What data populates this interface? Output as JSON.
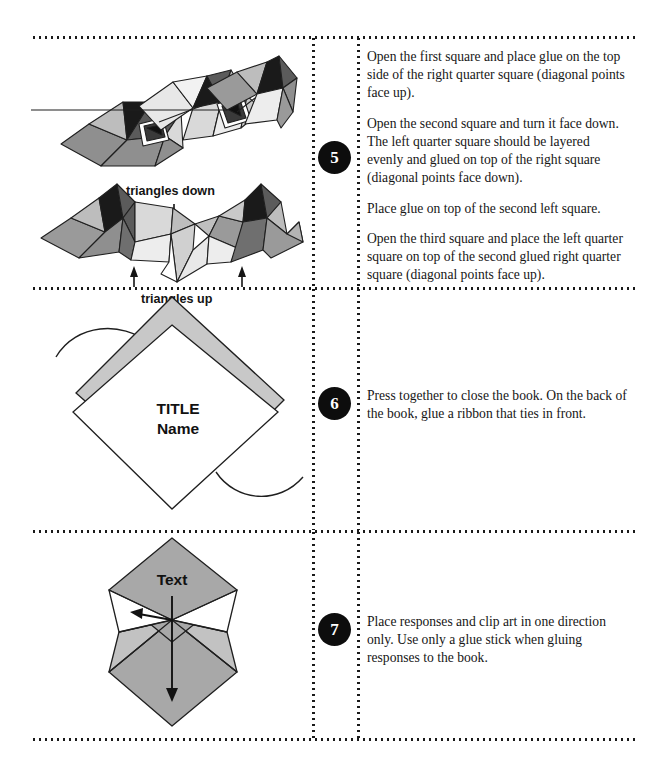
{
  "page": {
    "width": 670,
    "height": 772,
    "background": "#ffffff",
    "rule_color": "#1a1a1a"
  },
  "palette": {
    "ink": "#161616",
    "outline": "#1f1f1f",
    "near_black": "#1a1a1a",
    "dark_gray": "#5b5b5b",
    "mid_gray": "#8f8f8f",
    "light_gray": "#bdbdbd",
    "pale_gray": "#d9d9d9",
    "band_gray": "#c8c8c8",
    "white": "#ffffff",
    "circle_fill": "#0d0d0d",
    "circle_text": "#ffffff"
  },
  "steps": [
    {
      "number": "5",
      "figure": {
        "name": "folded-squares-diagram",
        "labels": [
          {
            "text": "triangles down",
            "x": 143,
            "y": 154
          },
          {
            "text": "triangles up",
            "x": 150,
            "y": 262
          }
        ]
      },
      "paragraphs": [
        "Open the first square and place glue on the top side of the right quarter square (diagonal points face up).",
        "Open the second square and turn it face down. The left quarter square should be layered evenly and glued on top of the right square (diagonal points face down).",
        "Place glue on top of the second left square.",
        "Open the third square and place the left quarter square on top of the second glued right quarter square (diagonal points face up)."
      ]
    },
    {
      "number": "6",
      "figure": {
        "name": "title-diamond-diagram",
        "labels": [
          {
            "text": "TITLE",
            "x": 168,
            "y": 408
          },
          {
            "text": "Name",
            "x": 168,
            "y": 427
          }
        ]
      },
      "paragraphs": [
        "Press together to close the book. On the back of the book, glue a ribbon that ties in front."
      ]
    },
    {
      "number": "7",
      "figure": {
        "name": "text-diamond-diagram",
        "labels": [
          {
            "text": "Text",
            "x": 168,
            "y": 588
          }
        ]
      },
      "paragraphs": [
        "Place responses and clip art in one direction only. Use only a glue stick when gluing responses to the book."
      ]
    }
  ],
  "rules": {
    "horizontal_y": [
      36,
      287,
      530,
      738
    ],
    "vertical_x": [
      312,
      357
    ],
    "vertical_spans": [
      [
        36,
        287
      ],
      [
        287,
        530
      ],
      [
        530,
        738
      ]
    ]
  }
}
